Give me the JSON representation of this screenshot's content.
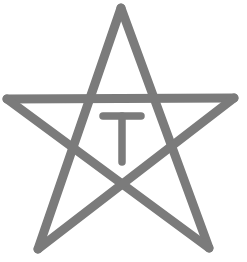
{
  "logo": {
    "shape": "pentagram-star",
    "letter": "T",
    "colors": {
      "stroke": "#7b7b7b",
      "background": "#ffffff"
    },
    "star_vertices": {
      "top": [
        121,
        8
      ],
      "left": [
        7,
        99
      ],
      "right": [
        234,
        98
      ],
      "bottom_left": [
        38,
        249
      ],
      "bottom_right": [
        209,
        248
      ]
    },
    "stroke_width": 9,
    "letter_stroke_width": 7.5
  }
}
